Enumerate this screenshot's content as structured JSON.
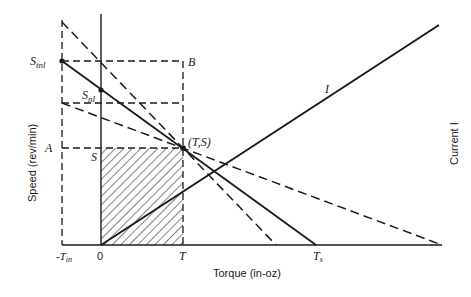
{
  "diagram": {
    "type": "motor torque-speed characteristic",
    "axes": {
      "x_label": "Torque (in-oz)",
      "y_label": "Speed (rev/min)",
      "y2_label": "Current I"
    },
    "x_ticks": [
      {
        "label": "-T",
        "sub": "in",
        "x": 62
      },
      {
        "label": "0",
        "x": 101
      },
      {
        "label": "T",
        "x": 183
      },
      {
        "label": "T",
        "sub": "s",
        "x": 316
      }
    ],
    "point_labels": {
      "s_tnl": {
        "main": "S",
        "sub": "tnl"
      },
      "s_nl": {
        "main": "S",
        "sub": "nl"
      },
      "b": "B",
      "a": "A",
      "s": "S",
      "ts": "(T,S)",
      "current": "I"
    },
    "colors": {
      "line": "#1a1a1a",
      "background": "#ffffff"
    }
  }
}
